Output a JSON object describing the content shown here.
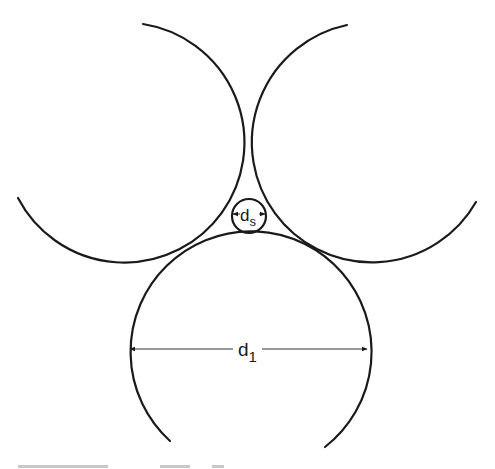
{
  "figure": {
    "labels": {
      "small_diameter": "d",
      "small_diameter_sub": "s",
      "large_diameter": "d",
      "large_diameter_sub": "1"
    },
    "circles": {
      "upper_left": {
        "cx": 128,
        "cy": 148,
        "r": 120
      },
      "upper_right": {
        "cx": 368,
        "cy": 148,
        "r": 120
      },
      "bottom": {
        "cx": 248.5,
        "cy": 349,
        "r": 120.5
      },
      "small": {
        "cx": 249,
        "cy": 216,
        "r": 17
      }
    },
    "colors": {
      "stroke": "#1a1a1a",
      "background": "#ffffff"
    },
    "caption": ""
  }
}
